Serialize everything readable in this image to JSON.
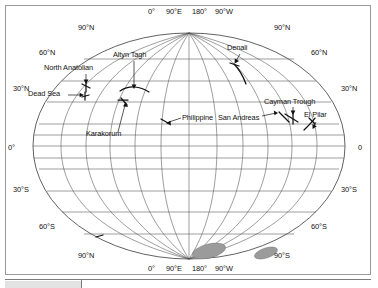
{
  "figure": {
    "kind": "world-map",
    "projection": "pseudocylindrical-elliptical",
    "title": "",
    "background_color": "#ffffff",
    "frame_color": "#9a9a9a",
    "graticule_color": "#4d4d4d",
    "fault_color": "#111111",
    "shaded_region_color": "#9b9b9b"
  },
  "axes": {
    "longitude_top": [
      {
        "label": "0°",
        "x": 147,
        "y": 9
      },
      {
        "label": "90°E",
        "x": 168,
        "y": 9
      },
      {
        "label": "180°",
        "x": 193,
        "y": 9
      },
      {
        "label": "90°W",
        "x": 216,
        "y": 9
      }
    ],
    "longitude_bottom": [
      {
        "label": "0°",
        "x": 147,
        "y": 263
      },
      {
        "label": "90°E",
        "x": 167,
        "y": 263
      },
      {
        "label": "180°",
        "x": 193,
        "y": 263
      },
      {
        "label": "90°W",
        "x": 216,
        "y": 263
      }
    ],
    "latitude_left": [
      {
        "label": "90°N",
        "x": 89,
        "y": 23
      },
      {
        "label": "60°N",
        "x": 42,
        "y": 48
      },
      {
        "label": "30°N",
        "x": 12,
        "y": 84
      },
      {
        "label": "0°",
        "x": 5,
        "y": 145
      },
      {
        "label": "30°S",
        "x": 12,
        "y": 186
      },
      {
        "label": "60°S",
        "x": 42,
        "y": 224
      },
      {
        "label": "90°N",
        "x": 89,
        "y": 251
      }
    ],
    "latitude_right": [
      {
        "label": "90°N",
        "x": 265,
        "y": 23
      },
      {
        "label": "60°N",
        "x": 309,
        "y": 48
      },
      {
        "label": "30°N",
        "x": 340,
        "y": 84
      },
      {
        "label": "0",
        "x": 358,
        "y": 145
      },
      {
        "label": "30°S",
        "x": 340,
        "y": 186
      },
      {
        "label": "60°S",
        "x": 309,
        "y": 224
      },
      {
        "label": "90°S",
        "x": 265,
        "y": 251
      }
    ],
    "graticule_spacing": {
      "meridians_deg": 30,
      "parallels_deg": 15
    }
  },
  "map_labels": [
    {
      "name": "North Anatolian",
      "text": "North Anatolian",
      "x": 45,
      "y": 62
    },
    {
      "name": "Dead Sea",
      "text": "Dead Sea",
      "x": 28,
      "y": 88
    },
    {
      "name": "Altyn Tagh",
      "text": "Altyn Tagh",
      "x": 110,
      "y": 48
    },
    {
      "name": "Karakorum",
      "text": "Karakorum",
      "x": 90,
      "y": 129
    },
    {
      "name": "Philippine",
      "text": "Philippine",
      "x": 177,
      "y": 112
    },
    {
      "name": "San Andreas",
      "text": "San Andreas",
      "x": 220,
      "y": 112
    },
    {
      "name": "Denali",
      "text": "Denali",
      "x": 220,
      "y": 41
    },
    {
      "name": "Cayman Trough",
      "text": "Cayman Trough",
      "x": 264,
      "y": 96
    },
    {
      "name": "El Pilar",
      "text": "El Pilar",
      "x": 301,
      "y": 110
    }
  ],
  "shaded_regions": [
    {
      "name": "antarctic-shaded-region-1",
      "cx": 203,
      "cy": 245,
      "rx": 17,
      "ry": 7,
      "rotation": -14
    },
    {
      "name": "antarctic-shaded-region-2",
      "cx": 260,
      "cy": 247,
      "rx": 12,
      "ry": 5,
      "rotation": -18
    }
  ],
  "table": {
    "visible_fragment": true,
    "columns": [
      "",
      ""
    ],
    "divider_x": 76
  }
}
